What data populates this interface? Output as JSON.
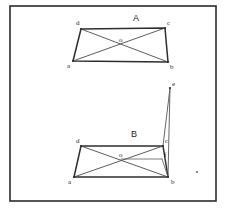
{
  "canvas": {
    "width": 226,
    "height": 211,
    "background": "#ffffff"
  },
  "frame": {
    "x": 10,
    "y": 6,
    "width": 206,
    "height": 195,
    "stroke": "#2b2b2b"
  },
  "figures": [
    {
      "id": "figure-a",
      "caption": "A",
      "caption_pos": {
        "x": 133,
        "y": 21
      },
      "points": {
        "a": {
          "x": 73,
          "y": 61,
          "label": "a",
          "label_x": 67,
          "label_y": 68
        },
        "b": {
          "x": 168,
          "y": 62,
          "label": "b",
          "label_x": 170,
          "label_y": 69
        },
        "c": {
          "x": 165,
          "y": 28,
          "label": "c",
          "label_x": 167,
          "label_y": 25
        },
        "d": {
          "x": 81,
          "y": 29,
          "label": "d",
          "label_x": 76,
          "label_y": 25
        },
        "o": {
          "x": 121,
          "y": 44,
          "label": "o",
          "label_x": 119,
          "label_y": 42
        }
      },
      "edges": [
        [
          "a",
          "b"
        ],
        [
          "b",
          "c"
        ],
        [
          "c",
          "d"
        ],
        [
          "d",
          "a"
        ]
      ],
      "diagonals": [
        [
          "a",
          "c"
        ],
        [
          "b",
          "d"
        ]
      ]
    },
    {
      "id": "figure-b",
      "caption": "B",
      "caption_pos": {
        "x": 131,
        "y": 137
      },
      "points": {
        "a": {
          "x": 74,
          "y": 177,
          "label": "a",
          "label_x": 68,
          "label_y": 184
        },
        "b": {
          "x": 168,
          "y": 177,
          "label": "b",
          "label_x": 171,
          "label_y": 184
        },
        "c": {
          "x": 163,
          "y": 146,
          "label": "c",
          "label_x": 165,
          "label_y": 143
        },
        "d": {
          "x": 81,
          "y": 146,
          "label": "d",
          "label_x": 76,
          "label_y": 143
        },
        "o": {
          "x": 121,
          "y": 159,
          "label": "o",
          "label_x": 119,
          "label_y": 157
        },
        "e": {
          "x": 170,
          "y": 88,
          "label": "e",
          "label_x": 172,
          "label_y": 86
        },
        "f": {
          "x": 162,
          "y": 159,
          "label": "f",
          "label_x": 164,
          "label_y": 157
        }
      },
      "edges": [
        [
          "a",
          "b"
        ],
        [
          "b",
          "c"
        ],
        [
          "c",
          "d"
        ],
        [
          "d",
          "a"
        ]
      ],
      "diagonals": [
        [
          "a",
          "c"
        ],
        [
          "b",
          "d"
        ]
      ],
      "spikes": [
        [
          "e",
          "b"
        ],
        [
          "e",
          "c"
        ]
      ],
      "helpers": [
        [
          "o",
          "f"
        ],
        [
          "f",
          "b"
        ]
      ]
    }
  ],
  "stray_marks": [
    {
      "x": 197,
      "y": 172,
      "r": 1.1
    }
  ]
}
